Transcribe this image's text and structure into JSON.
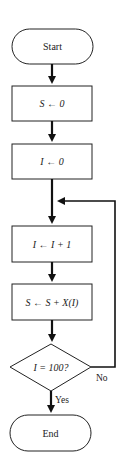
{
  "diagram": {
    "type": "flowchart",
    "nodes": [
      {
        "id": "start",
        "shape": "terminator",
        "label": "Start"
      },
      {
        "id": "init_s",
        "shape": "process",
        "label": "S ← 0"
      },
      {
        "id": "init_i",
        "shape": "process",
        "label": "I ← 0"
      },
      {
        "id": "inc_i",
        "shape": "process",
        "label": "I ← I + 1"
      },
      {
        "id": "accum",
        "shape": "process",
        "label": "S ← S + X(I)"
      },
      {
        "id": "check",
        "shape": "decision",
        "label": "I = 100?"
      },
      {
        "id": "end",
        "shape": "terminator",
        "label": "End"
      }
    ],
    "edges": [
      {
        "from": "start",
        "to": "init_s",
        "label": ""
      },
      {
        "from": "init_s",
        "to": "init_i",
        "label": ""
      },
      {
        "from": "init_i",
        "to": "inc_i",
        "label": ""
      },
      {
        "from": "inc_i",
        "to": "accum",
        "label": ""
      },
      {
        "from": "accum",
        "to": "check",
        "label": ""
      },
      {
        "from": "check",
        "to": "end",
        "label": "Yes"
      },
      {
        "from": "check",
        "to": "inc_i",
        "label": "No"
      }
    ],
    "colors": {
      "stroke": "#222222",
      "background": "#ffffff"
    }
  }
}
